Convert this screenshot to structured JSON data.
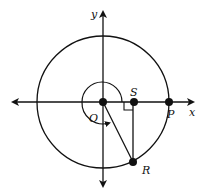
{
  "diagram": {
    "type": "unit-circle-geometry",
    "colors": {
      "stroke": "#111111",
      "background": "#ffffff"
    },
    "axes": {
      "x_label": "x",
      "y_label": "y"
    },
    "points": {
      "O": {
        "label": "O",
        "desc": "origin"
      },
      "S": {
        "label": "S",
        "desc": "foot of perpendicular from R on x-axis"
      },
      "P": {
        "label": "P",
        "desc": "intersection of circle with positive x-axis"
      },
      "R": {
        "label": "R",
        "desc": "point on circle in fourth quadrant"
      }
    },
    "elements": {
      "circle": "circle centered at O through P",
      "rotation_arc": "arc from positive x-axis counterclockwise to OR, with arrow",
      "segment_OR": "segment O to R",
      "segment_RS": "vertical segment R to S",
      "right_angle": "right-angle marker at S"
    }
  }
}
